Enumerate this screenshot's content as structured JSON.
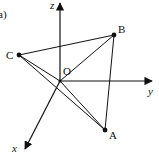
{
  "figure": {
    "panel_label": "a)",
    "background": "#ffffff",
    "stroke_color": "#111111"
  },
  "axes": {
    "z": {
      "label": "z",
      "tip": [
        60,
        1
      ]
    },
    "y": {
      "label": "y",
      "tip": [
        154,
        81
      ]
    },
    "x": {
      "label": "x",
      "tip": [
        24,
        151
      ]
    }
  },
  "points": {
    "O": {
      "label": "O",
      "pos": [
        60,
        81
      ]
    },
    "A": {
      "label": "A",
      "pos": [
        105,
        130
      ]
    },
    "B": {
      "label": "B",
      "pos": [
        114,
        35
      ]
    },
    "C": {
      "label": "C",
      "pos": [
        19,
        55
      ]
    }
  },
  "segments": [
    [
      "C",
      "B"
    ],
    [
      "C",
      "O"
    ],
    [
      "C",
      "A"
    ],
    [
      "O",
      "B"
    ],
    [
      "O",
      "A"
    ],
    [
      "B",
      "A"
    ]
  ]
}
